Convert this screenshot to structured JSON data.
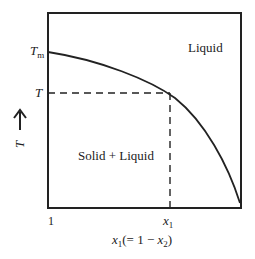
{
  "diagram": {
    "type": "phase-diagram",
    "regions": {
      "upper": "Liquid",
      "lower": "Solid + Liquid"
    },
    "y_axis": {
      "label": "T",
      "arrow": "up-arrow",
      "ticks": {
        "tm_main": "T",
        "tm_sub": "m",
        "t": "T"
      }
    },
    "x_axis": {
      "tick_left": "1",
      "tick_x1_main": "x",
      "tick_x1_sub": "1",
      "label_main": "x",
      "label_sub": "1",
      "label_rest_open": "(= 1 − ",
      "label_x2_main": "x",
      "label_x2_sub": "2",
      "label_close": ")"
    },
    "colors": {
      "line": "#222222",
      "background": "#ffffff"
    }
  }
}
